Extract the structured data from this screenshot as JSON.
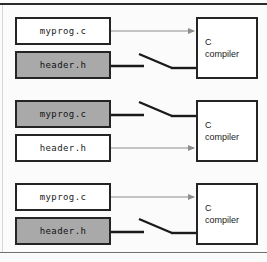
{
  "figure": {
    "width": 267,
    "height": 262,
    "background": "#fbfbfb",
    "rule_color": "#2b2b2b",
    "box_border_color": "#242424",
    "shaded_fill": "#a9a9a9",
    "white_fill": "#ffffff",
    "arrow_color": "#8c8c8c",
    "switch_color": "#1a1a1a"
  },
  "groups": [
    {
      "id": "group-1",
      "source": {
        "label": "myprog.c",
        "shaded": false,
        "connector": "arrow"
      },
      "header": {
        "label": "header.h",
        "shaded": true,
        "connector": "open-switch"
      },
      "target": {
        "line1": "C",
        "line2": "compiler"
      }
    },
    {
      "id": "group-2",
      "source": {
        "label": "myprog.c",
        "shaded": true,
        "connector": "open-switch"
      },
      "header": {
        "label": "header.h",
        "shaded": false,
        "connector": "arrow"
      },
      "target": {
        "line1": "C",
        "line2": "compiler"
      }
    },
    {
      "id": "group-3",
      "source": {
        "label": "myprog.c",
        "shaded": false,
        "connector": "arrow"
      },
      "header": {
        "label": "header.h",
        "shaded": true,
        "connector": "open-switch"
      },
      "target": {
        "line1": "C",
        "line2": "compiler"
      }
    }
  ]
}
